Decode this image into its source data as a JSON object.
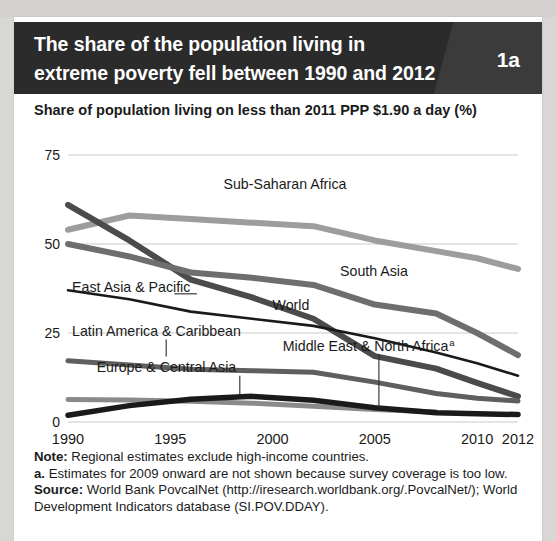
{
  "figure": {
    "number": "1a",
    "title": "The share of the population living in extreme poverty fell between 1990 and 2012",
    "subtitle": "Share of population living on less than 2011 PPP $1.90 a day (%)"
  },
  "notes": {
    "note_label": "Note:",
    "note_text": " Regional estimates exclude high-income countries.",
    "footnote_label": "a.",
    "footnote_text": " Estimates for 2009 onward are not shown because survey coverage is too low.",
    "source_label": "Source:",
    "source_text": " World Bank PovcalNet (http://iresearch.worldbank.org/.PovcalNet/); World Development Indicators database (SI.POV.DDAY)."
  },
  "chart_data": {
    "type": "line",
    "title": "The share of the population living in extreme poverty fell between 1990 and 2012",
    "subtitle": "Share of population living on less than 2011 PPP $1.90 a day (%)",
    "xlabel": "",
    "ylabel": "Share of population living on less than 2011 PPP $1.90 a day (%)",
    "xlim": [
      1990,
      2012
    ],
    "ylim": [
      0,
      75
    ],
    "yticks": [
      0,
      25,
      50,
      75
    ],
    "xticks": [
      1990,
      1995,
      2000,
      2005,
      2010,
      2012
    ],
    "xtick_labels": [
      "1990",
      "1995",
      "2000",
      "2005",
      "2010",
      "2012"
    ],
    "ytick_labels": [
      "0",
      "25",
      "50",
      "75"
    ],
    "grid": "horizontal",
    "legend": "inline-annotations",
    "series": [
      {
        "name": "Sub-Saharan Africa",
        "color": "#9d9d9d",
        "width": 6,
        "label_x": 1997.6,
        "label_y": 65.5,
        "x": [
          1990,
          1993,
          1996,
          1999,
          2002,
          2005,
          2008,
          2010,
          2012
        ],
        "y": [
          54.0,
          58.0,
          57.0,
          56.0,
          55.0,
          51.0,
          48.0,
          46.0,
          43.0
        ]
      },
      {
        "name": "East Asia & Pacific",
        "color": "#4b4b4b",
        "width": 6,
        "label_x": 1990.2,
        "label_y": 36.5,
        "leader": {
          "x1": 1995.2,
          "y1": 36.0,
          "x2": 1996.3,
          "y2": 36.0
        },
        "x": [
          1990,
          1993,
          1996,
          1999,
          2002,
          2005,
          2008,
          2010,
          2012
        ],
        "y": [
          61.0,
          51.0,
          40.0,
          35.0,
          29.0,
          18.5,
          15.0,
          11.0,
          7.2
        ]
      },
      {
        "name": "South Asia",
        "color": "#6e6e6e",
        "width": 6,
        "label_x": 2003.3,
        "label_y": 41.0,
        "x": [
          1990,
          1993,
          1996,
          1999,
          2002,
          2005,
          2008,
          2010,
          2012
        ],
        "y": [
          50.0,
          46.5,
          42.0,
          40.5,
          38.5,
          33.0,
          30.5,
          25.0,
          18.8
        ]
      },
      {
        "name": "World",
        "color": "#1a1a1a",
        "width": 2.6,
        "label_x": 2000.0,
        "label_y": 31.5,
        "x": [
          1990,
          1993,
          1996,
          1999,
          2002,
          2005,
          2008,
          2010,
          2012
        ],
        "y": [
          37.0,
          34.5,
          31.0,
          29.0,
          27.0,
          23.5,
          19.5,
          16.5,
          13.0
        ]
      },
      {
        "name": "Latin America & Caribbean",
        "color": "#5f5f5f",
        "width": 5,
        "label_x": 1990.2,
        "label_y": 24.2,
        "leader": {
          "x1": 1994.8,
          "y1": 23.2,
          "x2": 1994.8,
          "y2": 18.4
        },
        "x": [
          1990,
          1993,
          1996,
          1999,
          2002,
          2005,
          2008,
          2010,
          2012
        ],
        "y": [
          17.2,
          16.0,
          14.8,
          14.4,
          14.0,
          11.2,
          8.0,
          6.7,
          5.9
        ]
      },
      {
        "name": "Middle East & North Africa",
        "color": "#8a8a8a",
        "width": 5,
        "label_x": 2000.5,
        "label_y": 20.0,
        "has_superscript": true,
        "superscript": "a",
        "leader": {
          "x1": 2005.2,
          "y1": 19.0,
          "x2": 2005.2,
          "y2": 4.0
        },
        "x": [
          1990,
          1993,
          1996,
          1999,
          2002,
          2005,
          2008
        ],
        "y": [
          6.3,
          6.2,
          5.8,
          5.3,
          4.4,
          3.5,
          2.8
        ]
      },
      {
        "name": "Europe & Central Asia",
        "color": "#1a1a1a",
        "width": 5.5,
        "label_x": 1991.4,
        "label_y": 14.0,
        "leader": {
          "x1": 1998.4,
          "y1": 13.0,
          "x2": 1998.4,
          "y2": 7.5
        },
        "x": [
          1990,
          1993,
          1996,
          1999,
          2002,
          2005,
          2008,
          2010,
          2012
        ],
        "y": [
          1.9,
          4.6,
          6.4,
          7.2,
          6.1,
          4.0,
          2.6,
          2.3,
          2.1
        ]
      }
    ]
  }
}
